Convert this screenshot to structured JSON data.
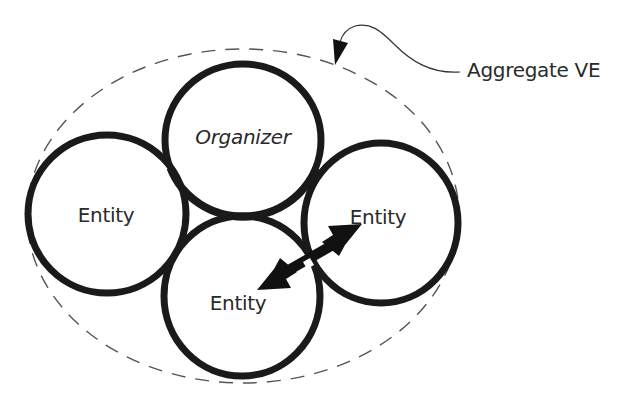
{
  "diagram": {
    "callout": {
      "label": "Aggregate VE"
    },
    "nodes": [
      {
        "id": "organizer",
        "label": "Organizer",
        "style": "italic"
      },
      {
        "id": "entity-left",
        "label": "Entity"
      },
      {
        "id": "entity-right",
        "label": "Entity"
      },
      {
        "id": "entity-bottom",
        "label": "Entity"
      }
    ],
    "edges": [
      {
        "from": "entity-bottom",
        "to": "entity-right",
        "type": "bidirectional-arrow"
      }
    ],
    "container": {
      "label": "Aggregate VE",
      "style": "dashed-ellipse"
    },
    "colors": {
      "stroke": "#1a1a1a",
      "text": "#2a2a2a",
      "dashed": "#555555",
      "background": "#ffffff"
    }
  }
}
